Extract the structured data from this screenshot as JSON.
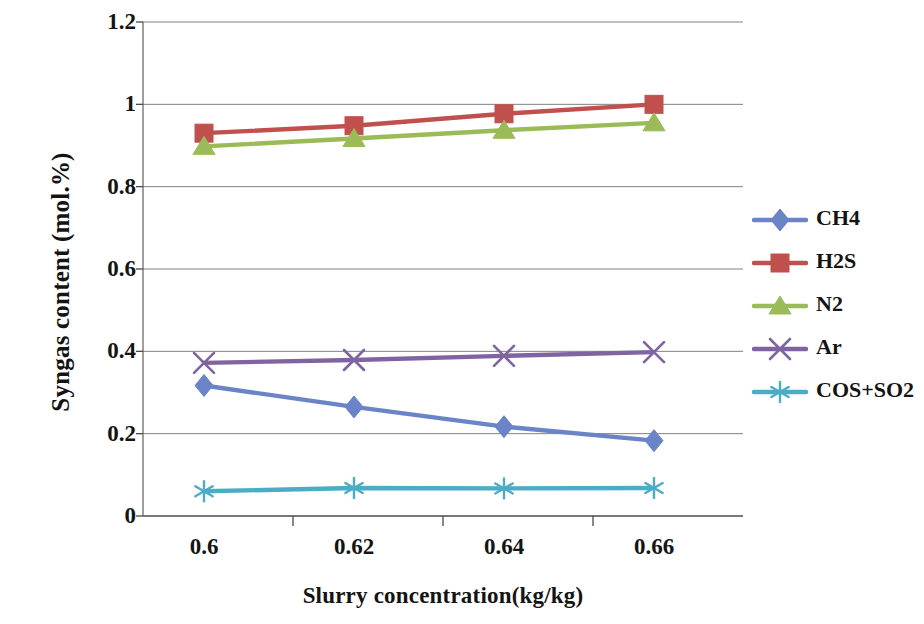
{
  "chart_data": {
    "type": "line",
    "title": "",
    "xlabel": "Slurry concentration(kg/kg)",
    "ylabel": "Syngas content (mol.%)",
    "x": [
      0.6,
      0.62,
      0.64,
      0.66
    ],
    "x_tick_labels": [
      "0.6",
      "0.62",
      "0.64",
      "0.66"
    ],
    "y_tick_labels": [
      "0",
      "0.2",
      "0.4",
      "0.6",
      "0.8",
      "1",
      "1.2"
    ],
    "y_ticks": [
      0,
      0.2,
      0.4,
      0.6,
      0.8,
      1,
      1.2
    ],
    "ylim": [
      0,
      1.2
    ],
    "xlim": [
      0.59,
      0.67
    ],
    "grid": true,
    "legend_position": "right",
    "series": [
      {
        "name": "CH4",
        "color": "#6B84C8",
        "marker": "diamond",
        "values": [
          0.317,
          0.265,
          0.217,
          0.183
        ]
      },
      {
        "name": "H2S",
        "color": "#C0504D",
        "marker": "square",
        "values": [
          0.93,
          0.948,
          0.977,
          1.0
        ]
      },
      {
        "name": "N2",
        "color": "#9BBB59",
        "marker": "triangle",
        "values": [
          0.898,
          0.917,
          0.937,
          0.955
        ]
      },
      {
        "name": "Ar",
        "color": "#8064A2",
        "marker": "x",
        "values": [
          0.372,
          0.379,
          0.389,
          0.398
        ]
      },
      {
        "name": "COS+SO2",
        "color": "#4BACC6",
        "marker": "asterisk",
        "values": [
          0.06,
          0.068,
          0.067,
          0.068
        ]
      }
    ]
  },
  "legend": {
    "items": [
      {
        "label": "CH4"
      },
      {
        "label": "H2S"
      },
      {
        "label": "N2"
      },
      {
        "label": "Ar"
      },
      {
        "label": "COS+SO2"
      }
    ]
  }
}
